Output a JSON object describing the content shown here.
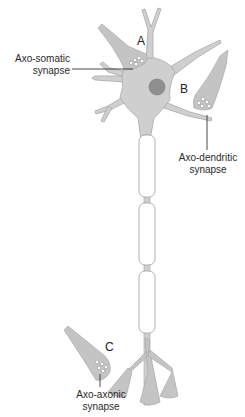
{
  "diagram": {
    "type": "neuron-synapse-types",
    "colors": {
      "cell_fill": "#cfcfcf",
      "cell_stroke": "#a8a8a8",
      "nucleus_fill": "#8f8f8f",
      "myelin_fill": "#ffffff",
      "terminal_fill": "#c4c4c4",
      "leader_line": "#333333",
      "text": "#2a2a2a"
    },
    "markers": {
      "a": "A",
      "b": "B",
      "c": "C"
    },
    "labels": {
      "axo_somatic_line1": "Axo-somatic",
      "axo_somatic_line2": "synapse",
      "axo_dendritic_line1": "Axo-dendritic",
      "axo_dendritic_line2": "synapse",
      "axo_axonic_line1": "Axo-axonic",
      "axo_axonic_line2": "synapse"
    },
    "myelin_segments": 3
  }
}
